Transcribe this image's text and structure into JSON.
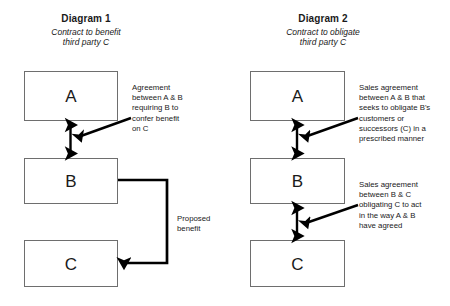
{
  "figure": {
    "background_color": "#ffffff",
    "box_border_color": "#6e6e6e",
    "arrow_color": "#000000",
    "text_color": "#1a1a1a"
  },
  "diagrams": [
    {
      "id": "diagram-1",
      "title": "Diagram 1",
      "subtitle_line_1": "Contract to benefit",
      "subtitle_line_2": "third party C",
      "nodes": [
        {
          "id": "a",
          "label": "A"
        },
        {
          "id": "b",
          "label": "B"
        },
        {
          "id": "c",
          "label": "C"
        }
      ],
      "connectors": [
        {
          "id": "a-b",
          "from": "A",
          "to": "B",
          "style": "double-headed-vertical-arrow"
        },
        {
          "id": "b-c",
          "from": "B",
          "to": "C",
          "style": "elbow-arrow-right-down-left"
        }
      ],
      "annotations": [
        {
          "id": "agreement-note",
          "text": "Agreement\nbetween A & B\nrequiring B to\nconfer benefit\non C",
          "pointer": "diagonal-arrow-to-lower-left"
        },
        {
          "id": "proposed-benefit-note",
          "text": "Proposed\nbenefit",
          "pointer": "none"
        }
      ]
    },
    {
      "id": "diagram-2",
      "title": "Diagram 2",
      "subtitle_line_1": "Contract to obligate",
      "subtitle_line_2": "third party C",
      "nodes": [
        {
          "id": "a",
          "label": "A"
        },
        {
          "id": "b",
          "label": "B"
        },
        {
          "id": "c",
          "label": "C"
        }
      ],
      "connectors": [
        {
          "id": "a-b",
          "from": "A",
          "to": "B",
          "style": "double-headed-vertical-arrow"
        },
        {
          "id": "b-c",
          "from": "B",
          "to": "C",
          "style": "double-headed-vertical-arrow"
        }
      ],
      "annotations": [
        {
          "id": "sales-agreement-ab-note",
          "text": "Sales agreement\nbetween A & B that\nseeks to obligate B's\ncustomers or\nsuccessors (C) in a\nprescribed manner",
          "pointer": "diagonal-arrow-to-lower-left"
        },
        {
          "id": "sales-agreement-bc-note",
          "text": "Sales agreement\nbetween B & C\nobligating C to act\nin the way A & B\nhave agreed",
          "pointer": "diagonal-arrow-to-lower-left"
        }
      ]
    }
  ]
}
